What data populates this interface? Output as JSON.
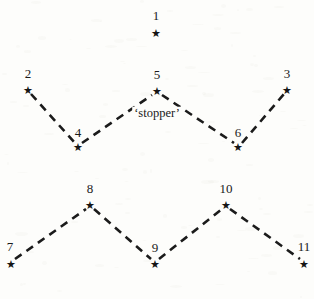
{
  "figure": {
    "width": 314,
    "height": 299,
    "background_color": "#fdfdfb",
    "ink_color": "#1a1a1a",
    "star_glyph": "★",
    "annotation": {
      "text": "‘stopper’",
      "x": 157,
      "y": 113
    },
    "nodes": [
      {
        "label": "1",
        "label_x": 156,
        "label_y": 15,
        "star_x": 156,
        "star_y": 33
      },
      {
        "label": "2",
        "label_x": 28,
        "label_y": 73,
        "star_x": 28,
        "star_y": 90
      },
      {
        "label": "5",
        "label_x": 157,
        "label_y": 74,
        "star_x": 157,
        "star_y": 91
      },
      {
        "label": "3",
        "label_x": 287,
        "label_y": 73,
        "star_x": 287,
        "star_y": 90
      },
      {
        "label": "4",
        "label_x": 78,
        "label_y": 132,
        "star_x": 78,
        "star_y": 147
      },
      {
        "label": "6",
        "label_x": 238,
        "label_y": 132,
        "star_x": 238,
        "star_y": 147
      },
      {
        "label": "8",
        "label_x": 90,
        "label_y": 188,
        "star_x": 90,
        "star_y": 205
      },
      {
        "label": "10",
        "label_x": 226,
        "label_y": 188,
        "star_x": 226,
        "star_y": 205
      },
      {
        "label": "7",
        "label_x": 10,
        "label_y": 246,
        "star_x": 11,
        "star_y": 264
      },
      {
        "label": "9",
        "label_x": 155,
        "label_y": 247,
        "star_x": 155,
        "star_y": 264
      },
      {
        "label": "11",
        "label_x": 304,
        "label_y": 246,
        "star_x": 304,
        "star_y": 264
      }
    ],
    "edges": [
      {
        "from": "2",
        "to": "4",
        "x1": 31,
        "y1": 94,
        "x2": 75,
        "y2": 143
      },
      {
        "from": "4",
        "to": "5",
        "x1": 82,
        "y1": 143,
        "x2": 152,
        "y2": 95
      },
      {
        "from": "5",
        "to": "6",
        "x1": 162,
        "y1": 95,
        "x2": 234,
        "y2": 143
      },
      {
        "from": "6",
        "to": "3",
        "x1": 242,
        "y1": 143,
        "x2": 284,
        "y2": 94
      },
      {
        "from": "7",
        "to": "8",
        "x1": 15,
        "y1": 259,
        "x2": 86,
        "y2": 209
      },
      {
        "from": "8",
        "to": "9",
        "x1": 94,
        "y1": 209,
        "x2": 151,
        "y2": 259
      },
      {
        "from": "9",
        "to": "10",
        "x1": 159,
        "y1": 259,
        "x2": 222,
        "y2": 209
      },
      {
        "from": "10",
        "to": "11",
        "x1": 230,
        "y1": 209,
        "x2": 300,
        "y2": 259
      }
    ],
    "line_style": {
      "stroke": "#1b1b1b",
      "stroke_width": 2.6,
      "dash": "8 6"
    }
  }
}
